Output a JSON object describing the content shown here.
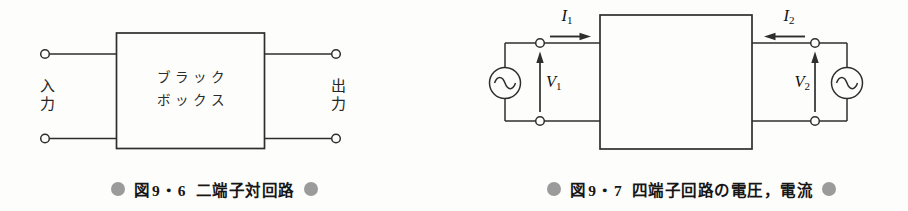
{
  "figure1": {
    "input_label": "入力",
    "output_label": "出力",
    "box_line1": "ブラック",
    "box_line2": "ボックス",
    "caption": {
      "fig": "図",
      "num": "9・6",
      "title": "二端子対回路"
    }
  },
  "figure2": {
    "i1": {
      "symbol": "I",
      "sub": "1"
    },
    "i2": {
      "symbol": "I",
      "sub": "2"
    },
    "v1": {
      "symbol": "V",
      "sub": "1"
    },
    "v2": {
      "symbol": "V",
      "sub": "2"
    },
    "caption": {
      "fig": "図",
      "num": "9・7",
      "title": "四端子回路の電圧，電流"
    }
  },
  "colors": {
    "background": "#fdfdfb",
    "line": "#2e2e2e",
    "caption_text": "#161616",
    "caption_bullet": "#9b9b9b"
  }
}
